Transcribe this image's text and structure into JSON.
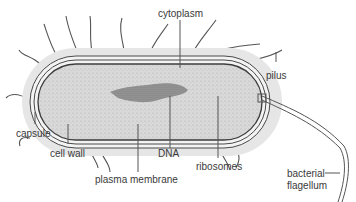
{
  "diagram": {
    "labels": {
      "cytoplasm": "cytoplasm",
      "pilus": "pilus",
      "capsule": "capsule",
      "cell_wall": "cell wall",
      "dna": "DNA",
      "ribosomes": "ribosomes",
      "plasma_membrane": "plasma membrane",
      "flagellum_line1": "bacterial",
      "flagellum_line2": "flagellum"
    },
    "colors": {
      "capsule": "#e4e4e4",
      "cytoplasm": "#d6d6d6",
      "dna": "#8a8a8a",
      "outline": "#4a4a4a",
      "text": "#3a3a3a"
    }
  }
}
